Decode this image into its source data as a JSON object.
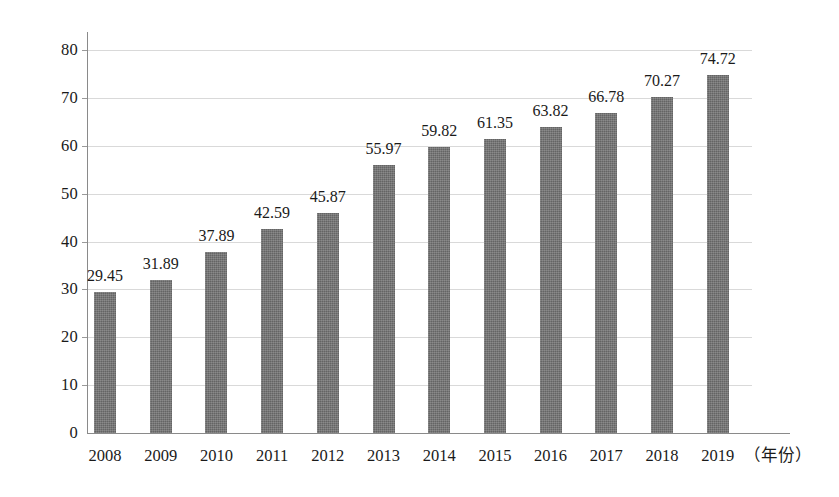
{
  "chart_data": {
    "type": "bar",
    "title": "",
    "subtitle": "",
    "xlabel": "（年份）",
    "ylabel": "",
    "categories": [
      "2008",
      "2009",
      "2010",
      "2011",
      "2012",
      "2013",
      "2014",
      "2015",
      "2016",
      "2017",
      "2018",
      "2019"
    ],
    "values": [
      29.45,
      31.89,
      37.89,
      42.59,
      45.87,
      55.97,
      59.82,
      61.35,
      63.82,
      66.78,
      70.27,
      74.72
    ],
    "value_labels": [
      "29.45",
      "31.89",
      "37.89",
      "42.59",
      "45.87",
      "55.97",
      "59.82",
      "61.35",
      "63.82",
      "66.78",
      "70.27",
      "74.72"
    ],
    "ylim": [
      0,
      80
    ],
    "ytick_values": [
      0,
      10,
      20,
      30,
      40,
      50,
      60,
      70,
      80
    ],
    "ytick_labels": [
      "0",
      "10",
      "20",
      "30",
      "40",
      "50",
      "60",
      "70",
      "80"
    ],
    "grid": true,
    "grid_axis": "y",
    "legend": false,
    "legend_position": "none",
    "bar_color": "#707070",
    "grid_color": "#d9d9d9",
    "axis_color": "#8a8a8a",
    "text_color": "#1a1a1a",
    "data_labels_shown": true
  }
}
